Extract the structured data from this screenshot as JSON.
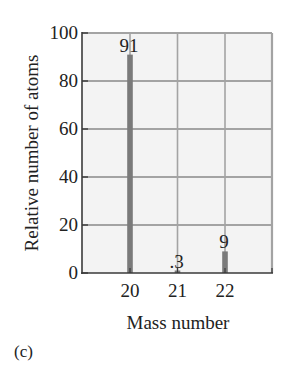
{
  "figure": {
    "caption": "(c)"
  },
  "colors": {
    "plot_background": "#f3f3f3",
    "gridline": "#a3a3a3",
    "axis": "#3a3a3a",
    "bar": "#7a7a7a",
    "text": "#222222"
  },
  "chart_data": {
    "type": "bar",
    "title": "",
    "xlabel": "Mass number",
    "ylabel": "Relative number of atoms",
    "categories": [
      "20",
      "21",
      "22"
    ],
    "values": [
      91,
      0.3,
      9
    ],
    "data_labels": [
      "91",
      ".3",
      "9"
    ],
    "x_ticks": [
      "20",
      "21",
      "22"
    ],
    "y_ticks": [
      "0",
      "20",
      "40",
      "60",
      "80",
      "100"
    ],
    "xlim": [
      19,
      23
    ],
    "ylim": [
      0,
      100
    ],
    "grid": true,
    "legend": null
  }
}
